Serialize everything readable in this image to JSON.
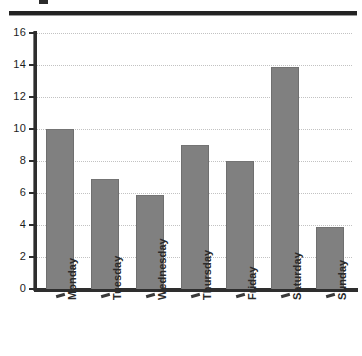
{
  "chart_data": {
    "type": "bar",
    "title": "",
    "xlabel": "",
    "ylabel": "",
    "categories": [
      "Monday",
      "Tuesday",
      "Wednesday",
      "Thursday",
      "Friday",
      "Saturday",
      "Sunday"
    ],
    "values": [
      10,
      6.9,
      5.85,
      9,
      8,
      13.85,
      3.9
    ],
    "ylim": [
      0,
      16
    ],
    "yticks": [
      0,
      2,
      4,
      6,
      8,
      10,
      12,
      14,
      16
    ],
    "ytick_labels": [
      "0",
      "2",
      "4",
      "6",
      "8",
      "10",
      "12",
      "14",
      "16"
    ],
    "grid": true,
    "grid_axis": "y",
    "grid_style": "dotted",
    "legend": false,
    "bar_color": "#808080",
    "bar_edge_color": "#6f6f6f",
    "axis_color": "#2e2e2e",
    "grid_color": "#c2c2c2",
    "xtick_label_rotation": 90
  },
  "page": {
    "background": "#ffffff",
    "rule_color": "#232323"
  }
}
